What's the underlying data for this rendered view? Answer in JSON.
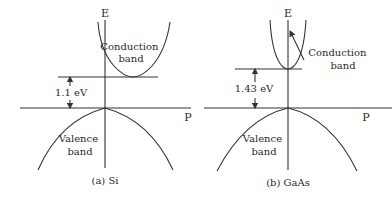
{
  "panels": [
    {
      "id": "si",
      "caption": "(a) Si",
      "axis_e_label": "E",
      "axis_p_label": "P",
      "gap_label": "1.1 eV",
      "conduction_label_line1": "Conduction",
      "conduction_label_line2": "band",
      "valence_label_line1": "Valence",
      "valence_label_line2": "band",
      "band_gap_type": "indirect"
    },
    {
      "id": "gaas",
      "caption": "(b) GaAs",
      "axis_e_label": "E",
      "axis_p_label": "P",
      "gap_label": "1.43 eV",
      "conduction_label_line1": "Conduction",
      "conduction_label_line2": "band",
      "valence_label_line1": "Valence",
      "valence_label_line2": "band",
      "band_gap_type": "direct"
    }
  ],
  "colors": {
    "line": "#333333",
    "text": "#2a2a2a",
    "background": "#ffffff"
  }
}
